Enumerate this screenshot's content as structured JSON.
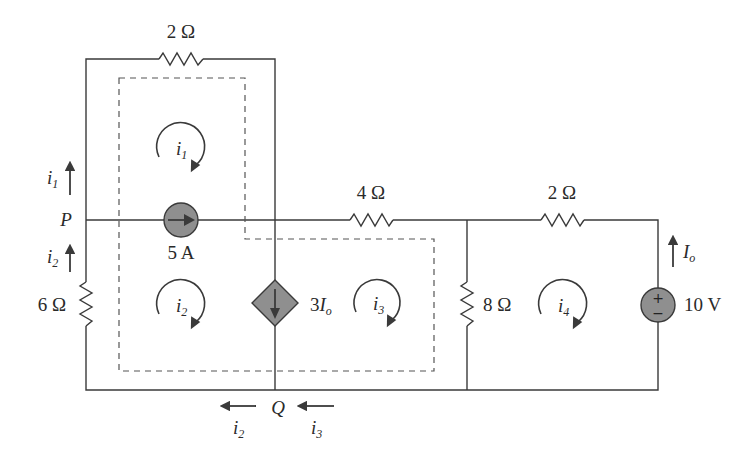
{
  "diagram": {
    "type": "circuit",
    "components": {
      "r_top": {
        "label": "2 Ω",
        "value_ohm": 2
      },
      "r_mid": {
        "label": "4 Ω",
        "value_ohm": 4
      },
      "r_right_top": {
        "label": "2 Ω",
        "value_ohm": 2
      },
      "r_left": {
        "label": "6 Ω",
        "value_ohm": 6
      },
      "r_shunt": {
        "label": "8 Ω",
        "value_ohm": 8
      },
      "current_source": {
        "label": "5 A",
        "value_a": 5
      },
      "dependent_source": {
        "label_coef": "3",
        "label_var": "I",
        "label_sub": "o"
      },
      "voltage_source": {
        "label": "10 V",
        "value_v": 10,
        "plus": "+",
        "minus": "−"
      }
    },
    "nodes": {
      "P": "P",
      "Q": "Q"
    },
    "mesh_currents": [
      {
        "name": "i",
        "sub": "1"
      },
      {
        "name": "i",
        "sub": "2"
      },
      {
        "name": "i",
        "sub": "3"
      },
      {
        "name": "i",
        "sub": "4"
      }
    ],
    "branch_labels": {
      "i1_left": {
        "name": "i",
        "sub": "1"
      },
      "i2_left": {
        "name": "i",
        "sub": "2"
      },
      "i2_bottom": {
        "name": "i",
        "sub": "2"
      },
      "i3_bottom": {
        "name": "i",
        "sub": "3"
      },
      "io": {
        "name": "I",
        "sub": "o"
      }
    }
  }
}
